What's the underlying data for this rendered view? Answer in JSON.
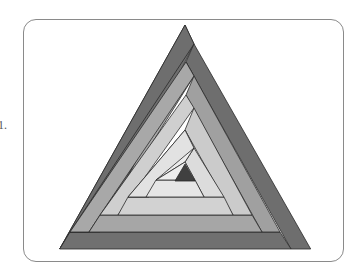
{
  "figure": {
    "marker_label": "1."
  },
  "colors": {
    "band1": "#6e6e6e",
    "band2": "#a4a4a4",
    "band3": "#cfcfcf",
    "band4": "#e4e4e4",
    "center": "#404040",
    "stroke": "#2a2a2a",
    "card_border": "#8a8a8a"
  }
}
